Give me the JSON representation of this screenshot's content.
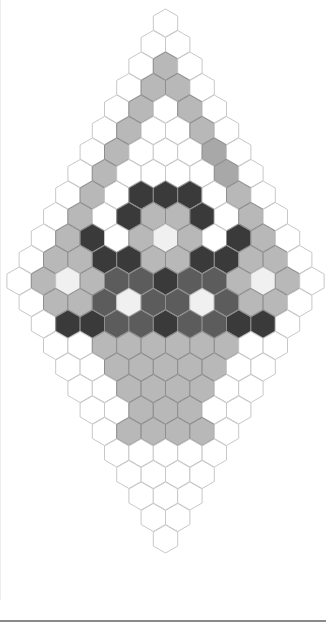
{
  "palette": {
    "W": "#ffffff",
    "G": "#b8b8b8",
    "S": "#a8a8a8",
    "L": "#f0f0f0",
    "M": "#5c5c5c",
    "D": "#3a3a3a",
    "stroke": "#c8c8c8"
  },
  "grid": {
    "top_center_x": 165.5,
    "top_center_y": 23,
    "col_step": 24.4,
    "row_step": 21.5,
    "hex_radius": 14
  },
  "rows": [
    "W",
    "WW",
    "WGW",
    "WGGW",
    "WGWGW",
    "WGWWGW",
    "WGWWWSW",
    "WGWWWWSW",
    "WGWDDDWGW",
    "WGWDGGDWGW",
    "WGDWGLGWDGW",
    "WGGDDGGDDGGW",
    "WGLGMMDMMGLGW",
    "WGGMLMMLMGGW",
    "WDDMMDMMDDW",
    "WWGGGGGGWW",
    "WWGGGGGWW",
    "WWGGGGWW",
    "WWGGGWW",
    "WGGGGW",
    "WWWWW",
    "WWWW",
    "WWW",
    "WW",
    "W"
  ]
}
